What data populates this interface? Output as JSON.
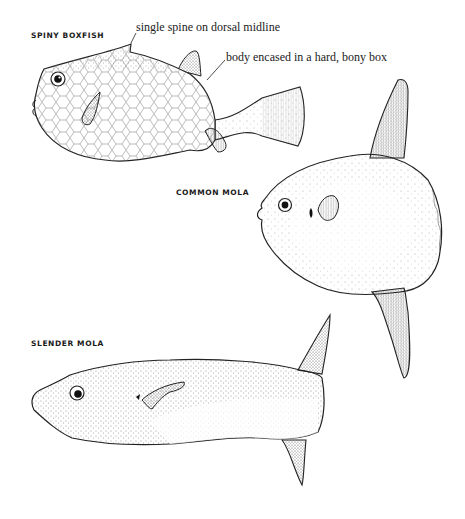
{
  "plate": {
    "background": "#ffffff",
    "ink_color": "#1a1a1a"
  },
  "species": [
    {
      "name": "SPINY BOXFISH",
      "annotations": [
        "single spine on dorsal midline",
        "body encased in a hard, bony box"
      ]
    },
    {
      "name": "COMMON MOLA",
      "annotations": []
    },
    {
      "name": "SLENDER MOLA",
      "annotations": []
    }
  ]
}
